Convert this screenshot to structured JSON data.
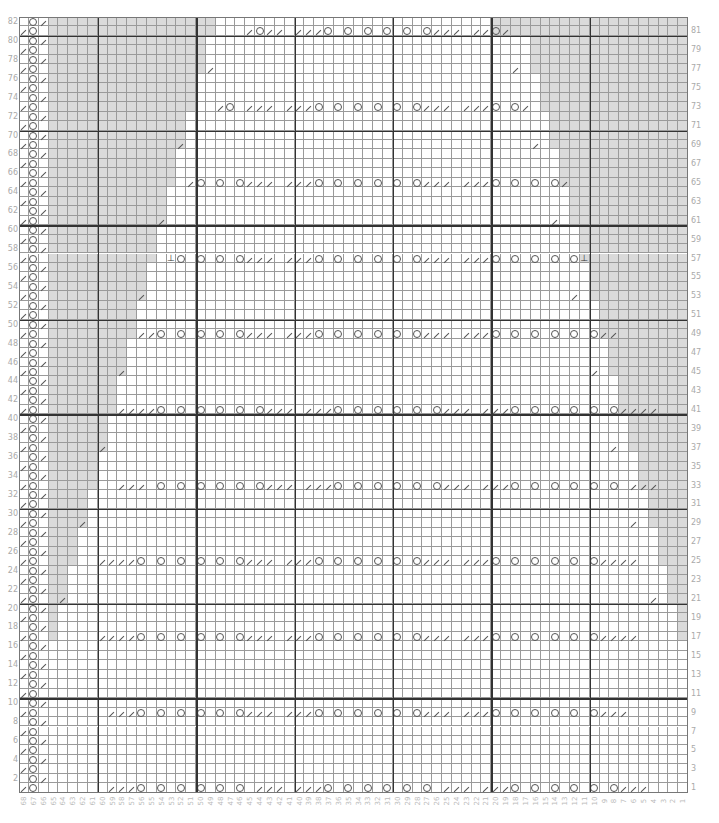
{
  "chart": {
    "columns": 68,
    "rows": 82,
    "cell_w": 9.84,
    "cell_h": 9.46,
    "thick_every": 10,
    "shade_color": "#dadada",
    "symbols": {
      "o": "yarn-over",
      "/": "k2tog",
      "^": "sl1-k2tog-psso",
      ".": "knit"
    },
    "left_row_labels": [
      "82",
      "80",
      "78",
      "76",
      "74",
      "72",
      "70",
      "68",
      "66",
      "64",
      "62",
      "60",
      "58",
      "56",
      "54",
      "52",
      "50",
      "48",
      "46",
      "44",
      "42",
      "40",
      "38",
      "36",
      "34",
      "32",
      "30",
      "28",
      "26",
      "24",
      "22",
      "20",
      "18",
      "16",
      "14",
      "12",
      "10",
      "8",
      "6",
      "4",
      "2"
    ],
    "right_row_labels": [
      "81",
      "79",
      "77",
      "75",
      "73",
      "71",
      "69",
      "67",
      "65",
      "63",
      "61",
      "59",
      "57",
      "55",
      "53",
      "51",
      "49",
      "47",
      "45",
      "43",
      "41",
      "39",
      "37",
      "35",
      "33",
      "31",
      "29",
      "27",
      "25",
      "23",
      "21",
      "19",
      "17",
      "15",
      "13",
      "11",
      "9",
      "7",
      "5",
      "3",
      "1"
    ],
    "edge_pattern": {
      "even": ".o/",
      "odd": "/o."
    },
    "pattern_rows": {
      "1": {
        "start": 59,
        "seq": "///o.o.o.o.o.o.///.///o.o.o.o.o.o.///.///o.o.o.o.o.o///"
      },
      "9": {
        "start": 59,
        "seq": "///o.o.o.o.o.o///.///o.o.o.o.o.o///.///o.o.o.o.o.o///"
      },
      "17": {
        "start": 60,
        "seq": "////o.o.o.o.o.o///.///o.o.o.o.o.o///.///o.o.o.o.o.o////"
      },
      "25": {
        "start": 60,
        "seq": "////o.o.o.o.o.o///.///o.o.o.o.o.o///.///o.o.o.o.o.o////"
      },
      "33": {
        "start": 58,
        "seq": "///.o.o.o.o.o.o///.///o.o.o.o.o.o///.///o.o.o.o.o.o.///"
      },
      "41": {
        "start": 58,
        "seq": "////o.o.o.o.o.o///.///o.o.o.o.o.o///.///o.o.o.o.o.o////"
      },
      "49": {
        "start": 56,
        "seq": "//o.o.o.o.o///.///o.o.o.o.o.o///.///o.o.o.o.o.o//"
      },
      "57": {
        "start": 53,
        "seq": "^o.o.o.o///.///o.o.o.o.o.o///.///o.o.o.o.o^"
      },
      "65": {
        "start": 51,
        "seq": "/o.o.o///.///o.o.o.o.o.o///.///o.o.o.o/"
      },
      "73": {
        "start": 48,
        "seq": "/o.///.///o.o.o.o.o.o///.///o.o/"
      },
      "81": {
        "start": 45,
        "seq": "/o//.///o.o.o.o.o.o///.//o/"
      }
    },
    "single_decreases": [
      {
        "row": 77,
        "col": 49
      },
      {
        "row": 77,
        "col": 18
      },
      {
        "row": 69,
        "col": 52
      },
      {
        "row": 69,
        "col": 16
      },
      {
        "row": 61,
        "col": 54
      },
      {
        "row": 61,
        "col": 14
      },
      {
        "row": 53,
        "col": 56
      },
      {
        "row": 53,
        "col": 12
      },
      {
        "row": 45,
        "col": 58
      },
      {
        "row": 45,
        "col": 10
      },
      {
        "row": 37,
        "col": 60
      },
      {
        "row": 37,
        "col": 8
      },
      {
        "row": 29,
        "col": 62
      },
      {
        "row": 29,
        "col": 6
      },
      {
        "row": 21,
        "col": 64
      },
      {
        "row": 21,
        "col": 4
      }
    ]
  }
}
